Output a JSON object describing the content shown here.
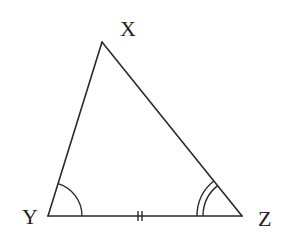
{
  "diagram": {
    "type": "triangle",
    "vertices": [
      {
        "id": "X",
        "label": "X",
        "x": 102,
        "y": 42,
        "label_x": 120,
        "label_y": 36
      },
      {
        "id": "Y",
        "label": "Y",
        "x": 48,
        "y": 216,
        "label_x": 22,
        "label_y": 224
      },
      {
        "id": "Z",
        "label": "Z",
        "x": 242,
        "y": 216,
        "label_x": 258,
        "label_y": 226
      }
    ],
    "sides": [
      {
        "from": "X",
        "to": "Y"
      },
      {
        "from": "Y",
        "to": "Z",
        "tick_marks": 2
      },
      {
        "from": "Z",
        "to": "X"
      }
    ],
    "angle_marks": [
      {
        "vertex": "Y",
        "arcs": 1
      },
      {
        "vertex": "Z",
        "arcs": 2
      }
    ],
    "colors": {
      "stroke": "#2a2a2a",
      "text": "#222222",
      "background": "#ffffff"
    }
  }
}
